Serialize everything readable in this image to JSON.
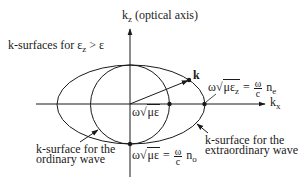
{
  "diagram": {
    "axes": {
      "vertical": {
        "symbol": "k",
        "subscript": "z",
        "note": "(optical axis)"
      },
      "horizontal": {
        "symbol": "k",
        "subscript": "x"
      }
    },
    "title_label": {
      "text": "k-surfaces for ε",
      "subscript": "z",
      "rest": " > ε"
    },
    "vector_label": "k",
    "annotations": {
      "extraordinary_intercept": {
        "prefix": "ω",
        "radicand": "με",
        "radicand_sub": "z",
        "equals": "=",
        "frac_num": "ω",
        "frac_den": "c",
        "index": "n",
        "index_sub": "e"
      },
      "circle_radius": {
        "prefix": "ω",
        "radicand": "με"
      },
      "ordinary_intercept": {
        "prefix": "ω",
        "radicand": "με",
        "equals": "=",
        "frac_num": "ω",
        "frac_den": "c",
        "index": "n",
        "index_sub": "o"
      }
    },
    "callouts": {
      "ordinary": {
        "line1": "k-surface for the",
        "line2": "ordinary wave"
      },
      "extraordinary": {
        "line1": "k-surface for the",
        "line2": "extraordinary wave"
      }
    },
    "colors": {
      "stroke": "#1a1a1a",
      "background": "#ffffff"
    },
    "geometry": {
      "origin": [
        130,
        104
      ],
      "circle_radius": 39.5,
      "ellipse_rx": 74,
      "ellipse_ry": 39.5,
      "k_point": [
        189,
        80
      ]
    }
  }
}
